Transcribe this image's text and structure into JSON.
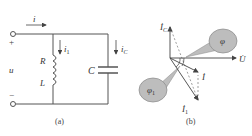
{
  "figure_a": {
    "caption": "(a)",
    "labels": {
      "i": "i",
      "i1": "i",
      "i1_sub": "1",
      "iC": "i",
      "iC_sub": "C",
      "R": "R",
      "L": "L",
      "C": "C",
      "u": "u",
      "plus": "+",
      "minus": "−"
    }
  },
  "figure_b": {
    "caption": "(b)",
    "labels": {
      "IC": "İ",
      "IC_sub": "C",
      "U": "U̇",
      "I": "İ",
      "I1": "İ",
      "I1_sub": "1",
      "phi": "φ",
      "phi1": "φ",
      "phi1_sub": "1"
    }
  },
  "colors": {
    "line": "#555555",
    "balloon": "#bdbdbd",
    "dashed": "#777777"
  }
}
